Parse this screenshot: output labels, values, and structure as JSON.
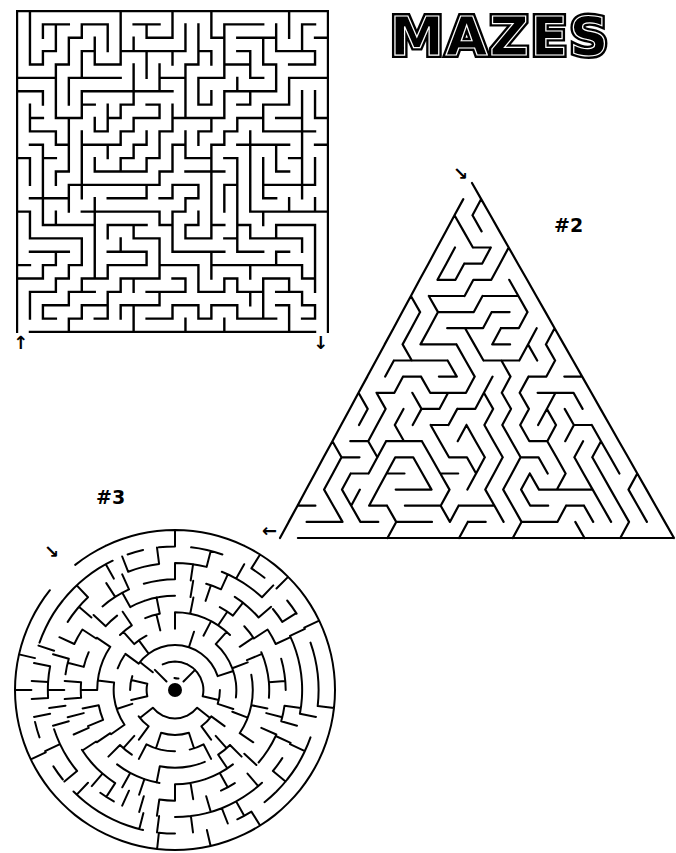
{
  "page": {
    "title": "MAZES",
    "background": "#ffffff",
    "ink": "#000000"
  },
  "mazes": [
    {
      "id": 1,
      "shape": "square",
      "label": "",
      "box": {
        "x": 16,
        "y": 10,
        "w": 311,
        "h": 321
      },
      "grid": {
        "cols": 24,
        "rows": 24
      },
      "start_arrow": {
        "glyph": "↑",
        "x": 13,
        "y": 334,
        "direction": "up"
      },
      "end_arrow": {
        "glyph": "↓",
        "x": 313,
        "y": 334,
        "direction": "down"
      },
      "seed": 11
    },
    {
      "id": 2,
      "shape": "triangle",
      "label": "#2",
      "label_pos": {
        "x": 554,
        "y": 214
      },
      "apex": {
        "x": 472,
        "y": 183
      },
      "base_left": {
        "x": 280,
        "y": 538
      },
      "base_right": {
        "x": 674,
        "y": 538
      },
      "levels": 22,
      "start_arrow": {
        "glyph": "↘",
        "x": 453,
        "y": 165,
        "direction": "down-right"
      },
      "end_arrow": {
        "glyph": "←",
        "x": 262,
        "y": 522,
        "direction": "left"
      },
      "seed": 23
    },
    {
      "id": 3,
      "shape": "circle",
      "label": "#3",
      "label_pos": {
        "x": 96,
        "y": 486
      },
      "center": {
        "x": 175,
        "y": 690
      },
      "radius": 160,
      "rings": 9,
      "goal": "center-dot",
      "start_arrow": {
        "glyph": "↘",
        "x": 44,
        "y": 543,
        "direction": "down-right"
      },
      "seed": 37
    }
  ]
}
